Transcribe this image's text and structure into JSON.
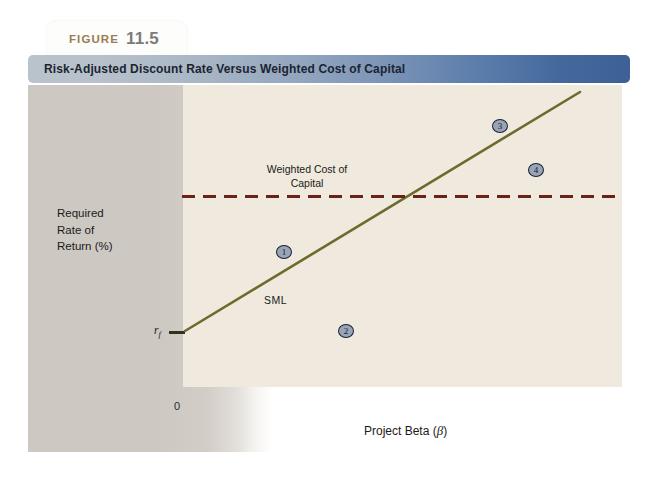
{
  "figure": {
    "label_word": "FIGURE",
    "number": "11.5",
    "title": "Risk-Adjusted Discount Rate Versus Weighted Cost of Capital"
  },
  "axes": {
    "y_label_line1": "Required",
    "y_label_line2": "Rate of",
    "y_label_line3": "Return (%)",
    "x_label_prefix": "Project Beta (",
    "x_label_symbol": "β",
    "x_label_suffix": ")",
    "origin_label": "0",
    "risk_free_label": "r",
    "risk_free_subscript": "f"
  },
  "annotations": {
    "wacc_line1": "Weighted Cost of",
    "wacc_line2": "Capital",
    "sml_label": "SML"
  },
  "markers": [
    {
      "id": "project-1",
      "label": "1",
      "x": 248,
      "y": 160
    },
    {
      "id": "project-2",
      "label": "2",
      "x": 310,
      "y": 239
    },
    {
      "id": "project-3",
      "label": "3",
      "x": 464,
      "y": 34
    },
    {
      "id": "project-4",
      "label": "4",
      "x": 500,
      "y": 78
    }
  ],
  "colors": {
    "sml_line": "#6b6b2e",
    "wacc_line": "#6b2218",
    "plot_background": "#efeadd",
    "band_background": "#cdc8c2",
    "title_gradient_start": "#b9c3cc",
    "title_gradient_end": "#3d6096",
    "figure_word": "#9a7b52",
    "figure_number": "#7b7b7b",
    "marker_fill": "#9aa4b4",
    "marker_stroke": "#16213a"
  },
  "chart_data": {
    "type": "line",
    "title": "Risk-Adjusted Discount Rate Versus Weighted Cost of Capital",
    "xlabel": "Project Beta (β)",
    "ylabel": "Required Rate of Return (%)",
    "grid": false,
    "legend": "none",
    "xlim": [
      0,
      1
    ],
    "ylim": [
      0,
      1
    ],
    "series": [
      {
        "name": "SML",
        "type": "line",
        "style": "solid",
        "color": "#6b6b2e",
        "x": [
          0.0,
          1.0
        ],
        "y": [
          0.185,
          0.97
        ],
        "note": "Security Market Line rising from the risk-free rate r_f at beta = 0"
      },
      {
        "name": "Weighted Cost of Capital",
        "type": "hline",
        "style": "dashed",
        "color": "#6b2218",
        "x": [
          0.0,
          1.0
        ],
        "y": [
          0.635,
          0.635
        ],
        "note": "Constant weighted average cost of capital, horizontal dashed line"
      }
    ],
    "points": [
      {
        "label": "1",
        "x": 0.22,
        "y": 0.47,
        "note": "below SML, below WACC line"
      },
      {
        "label": "2",
        "x": 0.36,
        "y": 0.21,
        "note": "below SML, far below WACC line"
      },
      {
        "label": "3",
        "x": 0.71,
        "y": 0.89,
        "note": "above SML, above WACC line"
      },
      {
        "label": "4",
        "x": 0.79,
        "y": 0.74,
        "note": "below SML, above WACC line"
      }
    ],
    "annotations": [
      {
        "text": "SML",
        "x": 0.2,
        "y": 0.31
      },
      {
        "text": "Weighted Cost of Capital",
        "x": 0.29,
        "y": 0.75
      },
      {
        "text": "r_f",
        "x": 0.0,
        "y": 0.185
      },
      {
        "text": "0",
        "x": 0.0,
        "y": 0.0
      }
    ]
  }
}
